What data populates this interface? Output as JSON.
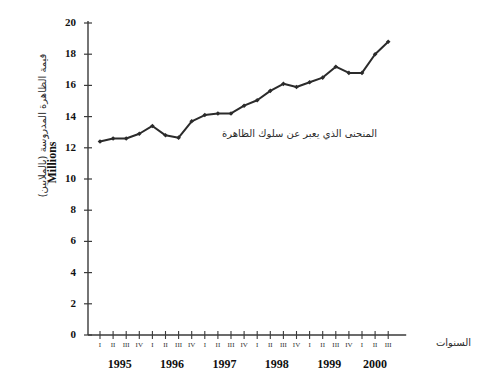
{
  "chart_data": {
    "type": "line",
    "title": "",
    "subtitle": "",
    "xlabel": "السنوات",
    "ylabel": "Millions",
    "ylabel_arabic": "قيمة الظاهرة المدروسة (بالملايين)",
    "annotation": "المنحنى الذي يعبر عن سلوك الظاهرة",
    "ylim": [
      0,
      20
    ],
    "ytick_step": 2,
    "yticks": [
      0,
      2,
      4,
      6,
      8,
      10,
      12,
      14,
      16,
      18,
      20
    ],
    "ytick_labels": [
      "0",
      "2",
      "4",
      "6",
      "8",
      "10",
      "12",
      "14",
      "16",
      "18",
      "20"
    ],
    "grid": false,
    "legend": "none",
    "marker": "diamond",
    "line_color": "#2b2b2b",
    "axis_color": "#3a3a3a",
    "categories": [
      "1995 I",
      "1995 II",
      "1995 III",
      "1995 IV",
      "1996 I",
      "1996 II",
      "1996 III",
      "1996 IV",
      "1997 I",
      "1997 II",
      "1997 III",
      "1997 IV",
      "1998 I",
      "1998 II",
      "1998 III",
      "1998 IV",
      "1999 I",
      "1999 II",
      "1999 III",
      "1999 IV",
      "2000 I",
      "2000 II",
      "2000 III"
    ],
    "quarter_labels": [
      "I",
      "II",
      "III",
      "IV",
      "I",
      "II",
      "III",
      "IV",
      "I",
      "II",
      "III",
      "IV",
      "I",
      "II",
      "III",
      "IV",
      "I",
      "II",
      "III",
      "IV",
      "I",
      "II",
      "III"
    ],
    "years": [
      {
        "label": "1995",
        "first_index": 0,
        "last_index": 3
      },
      {
        "label": "1996",
        "first_index": 4,
        "last_index": 7
      },
      {
        "label": "1997",
        "first_index": 8,
        "last_index": 11
      },
      {
        "label": "1998",
        "first_index": 12,
        "last_index": 15
      },
      {
        "label": "1999",
        "first_index": 16,
        "last_index": 19
      },
      {
        "label": "2000",
        "first_index": 20,
        "last_index": 22
      }
    ],
    "values": [
      12.4,
      12.6,
      12.6,
      12.9,
      13.4,
      12.8,
      12.65,
      13.7,
      14.1,
      14.2,
      14.2,
      14.7,
      15.05,
      15.65,
      16.1,
      15.9,
      16.2,
      16.5,
      17.2,
      16.8,
      16.8,
      18.0,
      18.8
    ]
  }
}
